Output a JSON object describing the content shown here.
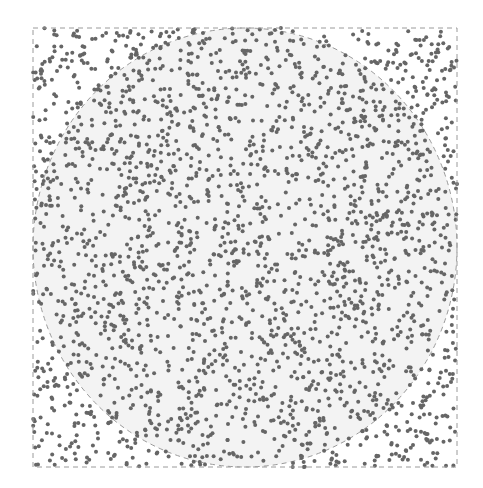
{
  "chart_data": {
    "type": "scatter",
    "title": "",
    "subtitle": "",
    "xlabel": "",
    "ylabel": "",
    "xlim": [
      -1,
      1
    ],
    "ylim": [
      -1,
      1
    ],
    "grid": false,
    "legend": null,
    "axes_visible": false,
    "shapes": {
      "square": {
        "x0": -1,
        "y0": -1,
        "x1": 1,
        "y1": 1,
        "stroke": "dashed",
        "color": "#9a9a9a"
      },
      "circle": {
        "cx": 0,
        "cy": 0,
        "r": 1,
        "stroke": "dashed",
        "color": "#9a9a9a",
        "fill": "#f3f3f3"
      }
    },
    "point_count_estimate": 2500,
    "point_color": "#666666",
    "point_radius_px": 2,
    "seed": 7
  },
  "layout": {
    "square_px": {
      "left": 33,
      "top": 28,
      "right": 457,
      "bottom": 467
    }
  }
}
